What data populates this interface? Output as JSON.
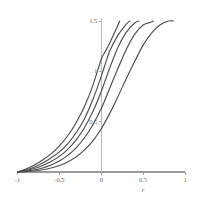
{
  "chart_data": {
    "type": "line",
    "title": "",
    "subtitle": "",
    "xlabel": "r",
    "ylabel": "",
    "xlim": [
      -1,
      1
    ],
    "ylim": [
      0,
      1.5
    ],
    "grid": false,
    "legend": false,
    "legend_position": "none",
    "annotations": [],
    "x_ticks": [
      {
        "value": -1,
        "label": "-1"
      },
      {
        "value": -0.5,
        "label": "-0.5"
      },
      {
        "value": 0,
        "label": "0"
      },
      {
        "value": 0.5,
        "label": "0.5"
      },
      {
        "value": 1,
        "label": "1"
      }
    ],
    "y_ticks": [
      {
        "value": 0.5,
        "label": "0.5"
      },
      {
        "value": 1,
        "label": "1"
      },
      {
        "value": 1.5,
        "label": "1.5"
      }
    ],
    "series": [
      {
        "name": "curve-1",
        "color": "#4d4d4d",
        "x": [
          -1,
          -0.9,
          -0.8,
          -0.7,
          -0.6,
          -0.5,
          -0.4,
          -0.3,
          -0.2,
          -0.1,
          0,
          0.05,
          0.1,
          0.15,
          0.2,
          0.22
        ],
        "values": [
          0.0,
          0.03,
          0.07,
          0.12,
          0.18,
          0.26,
          0.36,
          0.49,
          0.65,
          0.86,
          1.12,
          1.2,
          1.28,
          1.37,
          1.46,
          1.5
        ]
      },
      {
        "name": "curve-2",
        "color": "#4d4d4d",
        "x": [
          -1,
          -0.9,
          -0.8,
          -0.7,
          -0.6,
          -0.5,
          -0.4,
          -0.3,
          -0.2,
          -0.1,
          0,
          0.1,
          0.2,
          0.3,
          0.34
        ],
        "values": [
          0.0,
          0.02,
          0.05,
          0.09,
          0.14,
          0.2,
          0.28,
          0.39,
          0.53,
          0.72,
          0.95,
          1.2,
          1.36,
          1.47,
          1.5
        ]
      },
      {
        "name": "curve-3",
        "color": "#4d4d4d",
        "x": [
          -1,
          -0.9,
          -0.8,
          -0.7,
          -0.6,
          -0.5,
          -0.4,
          -0.3,
          -0.2,
          -0.1,
          0,
          0.1,
          0.2,
          0.3,
          0.4,
          0.45
        ],
        "values": [
          0.0,
          0.015,
          0.035,
          0.065,
          0.105,
          0.155,
          0.225,
          0.32,
          0.44,
          0.6,
          0.8,
          1.03,
          1.24,
          1.39,
          1.48,
          1.5
        ]
      },
      {
        "name": "curve-4",
        "color": "#4d4d4d",
        "x": [
          -1,
          -0.9,
          -0.8,
          -0.7,
          -0.6,
          -0.5,
          -0.4,
          -0.3,
          -0.2,
          -0.1,
          0,
          0.1,
          0.2,
          0.3,
          0.4,
          0.5,
          0.6,
          0.62
        ],
        "values": [
          0.0,
          0.008,
          0.02,
          0.04,
          0.07,
          0.11,
          0.165,
          0.24,
          0.34,
          0.47,
          0.63,
          0.83,
          1.03,
          1.22,
          1.37,
          1.46,
          1.49,
          1.5
        ]
      },
      {
        "name": "curve-5",
        "color": "#4d4d4d",
        "x": [
          -1,
          -0.9,
          -0.8,
          -0.7,
          -0.6,
          -0.5,
          -0.4,
          -0.3,
          -0.2,
          -0.1,
          0,
          0.1,
          0.2,
          0.3,
          0.4,
          0.5,
          0.6,
          0.7,
          0.8,
          0.86
        ],
        "values": [
          0.0,
          0.004,
          0.01,
          0.022,
          0.04,
          0.065,
          0.1,
          0.15,
          0.22,
          0.31,
          0.43,
          0.58,
          0.75,
          0.93,
          1.1,
          1.26,
          1.38,
          1.46,
          1.5,
          1.5
        ]
      }
    ],
    "colors": {
      "curve": "#4d4d4d",
      "axis": "#9a9a9a",
      "tick_text": "#6a6a6a",
      "background": "#ffffff"
    }
  }
}
